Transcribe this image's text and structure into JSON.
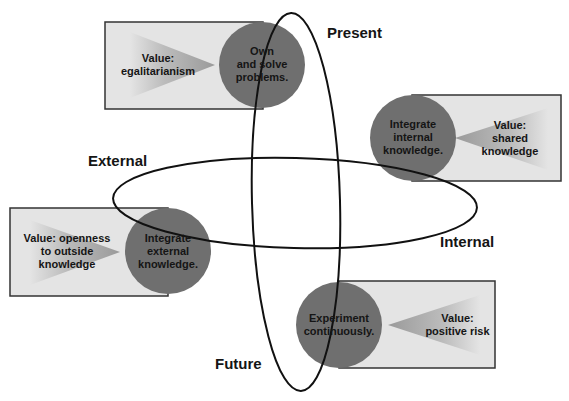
{
  "diagram": {
    "axis_labels": {
      "present": "Present",
      "future": "Future",
      "external": "External",
      "internal": "Internal"
    },
    "nodes": [
      {
        "id": "own-solve",
        "action": "Own\nand solve\nproblems.",
        "value": "Value:\negalitarianism",
        "quadrant": "present"
      },
      {
        "id": "integrate-internal",
        "action": "Integrate\ninternal\nknowledge.",
        "value": "Value:\nshared\nknowledge",
        "quadrant": "internal"
      },
      {
        "id": "integrate-external",
        "action": "Integrate\nexternal\nknowledge.",
        "value": "Value: openness\nto outside\nknowledge",
        "quadrant": "external"
      },
      {
        "id": "experiment",
        "action": "Experiment\ncontinuously.",
        "value": "Value:\npositive risk",
        "quadrant": "future"
      }
    ],
    "colors": {
      "circle": "#6f6f6f",
      "box": "#e4e4e4",
      "wedge": "#a8a8a8",
      "line": "#111111"
    }
  }
}
